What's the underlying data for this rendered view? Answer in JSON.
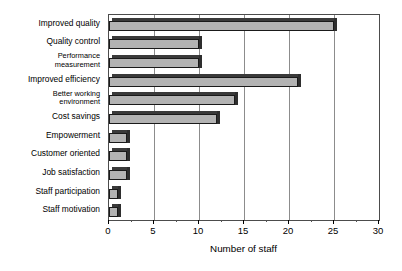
{
  "chart_data": {
    "type": "bar",
    "orientation": "horizontal",
    "title": "",
    "xlabel": "Number of staff",
    "ylabel": "",
    "xlim": [
      0,
      30
    ],
    "xticks": [
      0,
      5,
      10,
      15,
      20,
      25,
      30
    ],
    "xtick_labels": [
      "0",
      "5",
      "10",
      "15",
      "20",
      "25",
      "30"
    ],
    "grid": true,
    "grid_axis": "x",
    "legend": false,
    "style": "3d-bar",
    "bar_fill_color": "#b3b3b3",
    "bar_edge_color": "#1a1a1a",
    "bar_top_color": "#3a3a3a",
    "categories": [
      "Improved quality",
      "Quality control",
      "Performance\nmeasurement",
      "Improved efficiency",
      "Better working\nenvironment",
      "Cost savings",
      "Empowerment",
      "Customer oriented",
      "Job satisfaction",
      "Staff participation",
      "Staff motivation"
    ],
    "values": [
      25,
      10,
      10,
      21,
      14,
      12,
      2,
      2,
      2,
      1,
      1
    ]
  }
}
